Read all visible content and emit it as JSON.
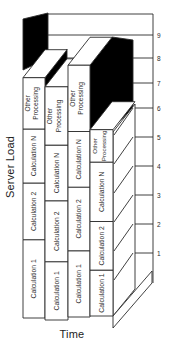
{
  "figure": {
    "y_axis_title": "Server Load",
    "x_axis_title": "Time"
  },
  "chart_data": {
    "type": "bar",
    "stacked": true,
    "projection": "3d-oblique",
    "title": "",
    "xlabel": "Time",
    "ylabel": "Server Load",
    "y_ticks": [
      "1",
      "2",
      "3",
      "4",
      "5",
      "6",
      "7",
      "8",
      "9"
    ],
    "ylim": [
      0,
      9
    ],
    "grid": true,
    "x_categories": [
      "",
      "",
      "",
      ""
    ],
    "segment_order": [
      "Calculation 1",
      "Calculation 2",
      "Calculation N",
      "Other Processing"
    ],
    "other_processing_lines": [
      "Other",
      "Processing"
    ],
    "bars": [
      {
        "segments": [
          2.9,
          2.1,
          2.0,
          1.9
        ],
        "total": 8.9
      },
      {
        "segments": [
          2.2,
          2.3,
          2.1,
          2.2
        ],
        "total": 8.8
      },
      {
        "segments": [
          2.5,
          2.4,
          2.1,
          2.5
        ],
        "total": 9.5
      },
      {
        "segments": [
          1.7,
          1.8,
          2.2,
          1.2
        ],
        "total": 6.9
      }
    ],
    "colors": {
      "bar_face": "#ffffff",
      "shadow": "#000000",
      "line": "#2b2b2b",
      "background": "#ffffff",
      "text": "#2b2b2b"
    }
  }
}
